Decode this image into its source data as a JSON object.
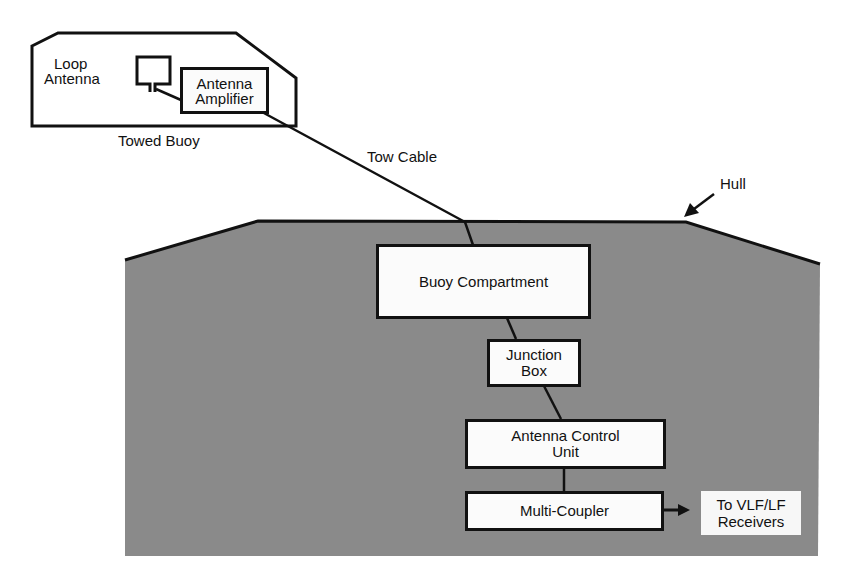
{
  "diagram": {
    "type": "block-diagram",
    "colors": {
      "hull_fill": "#8a8a8a",
      "line": "#111111",
      "box_fill": "#fbfbfb",
      "background": "#ffffff"
    },
    "towed_buoy": {
      "label": "Towed Buoy",
      "loop_antenna_label_line1": "Loop",
      "loop_antenna_label_line2": "Antenna",
      "amplifier_label_line1": "Antenna",
      "amplifier_label_line2": "Amplifier"
    },
    "tow_cable_label": "Tow Cable",
    "hull_label": "Hull",
    "blocks": {
      "buoy_compartment": "Buoy Compartment",
      "junction_box_line1": "Junction",
      "junction_box_line2": "Box",
      "antenna_control_unit_line1": "Antenna Control",
      "antenna_control_unit_line2": "Unit",
      "multi_coupler": "Multi-Coupler"
    },
    "output": {
      "line1": "To VLF/LF",
      "line2": "Receivers"
    },
    "connections": [
      [
        "Loop Antenna",
        "Antenna Amplifier"
      ],
      [
        "Antenna Amplifier",
        "Buoy Compartment",
        "Tow Cable"
      ],
      [
        "Buoy Compartment",
        "Junction Box"
      ],
      [
        "Junction Box",
        "Antenna Control Unit"
      ],
      [
        "Antenna Control Unit",
        "Multi-Coupler"
      ],
      [
        "Multi-Coupler",
        "To VLF/LF Receivers"
      ]
    ]
  }
}
